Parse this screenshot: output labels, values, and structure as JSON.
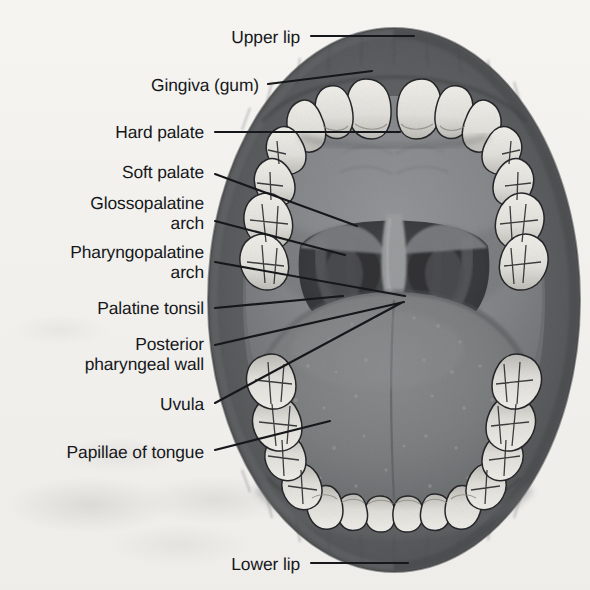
{
  "figure": {
    "view": "anterior view of open mouth",
    "style": "grayscale halftone textbook illustration on scanned paper"
  },
  "colors": {
    "paper": "#f2f1ee",
    "lip_outer": "#5d5f60",
    "lip_inner": "#4b4d4f",
    "mucosa": "#6f7173",
    "palate": "#828486",
    "tongue": "#7b7d7e",
    "throat_dark": "#3a3c3e",
    "tooth": "#e7e6e1",
    "tooth_shadow": "#b9b7b1",
    "outline": "#222325",
    "leader": "#16171a",
    "text": "#16171a"
  },
  "labels": [
    {
      "id": "upper-lip",
      "text": "Upper lip",
      "text_x": 300,
      "text_y": 37,
      "leader": [
        [
          311,
          36
        ],
        [
          414,
          36
        ]
      ],
      "lines": 1
    },
    {
      "id": "gingiva-gum",
      "text": "Gingiva (gum)",
      "text_x": 259,
      "text_y": 85,
      "leader": [
        [
          268,
          84
        ],
        [
          372,
          71
        ]
      ],
      "lines": 1
    },
    {
      "id": "hard-palate",
      "text": "Hard palate",
      "text_x": 204,
      "text_y": 132,
      "leader": [
        [
          215,
          132
        ],
        [
          400,
          132
        ]
      ],
      "lines": 1
    },
    {
      "id": "soft-palate",
      "text": "Soft palate",
      "text_x": 204,
      "text_y": 172,
      "leader": [
        [
          215,
          174
        ],
        [
          357,
          226
        ]
      ],
      "lines": 1
    },
    {
      "id": "glossopalatine-arch",
      "text": "Glossopalatine\narch",
      "text_x": 204,
      "text_y": 213,
      "leader": [
        [
          215,
          221
        ],
        [
          345,
          255
        ]
      ],
      "lines": 2
    },
    {
      "id": "pharyngopalatine-arch",
      "text": "Pharyngopalatine\narch",
      "text_x": 204,
      "text_y": 262,
      "leader": [
        [
          215,
          262
        ],
        [
          405,
          296
        ]
      ],
      "lines": 2
    },
    {
      "id": "palatine-tonsil",
      "text": "Palatine tonsil",
      "text_x": 204,
      "text_y": 308,
      "leader": [
        [
          215,
          308
        ],
        [
          343,
          296
        ]
      ],
      "lines": 1
    },
    {
      "id": "posterior-pharyngeal-wall",
      "text": "Posterior\npharyngeal wall",
      "text_x": 204,
      "text_y": 354,
      "leader": [
        [
          215,
          345
        ],
        [
          404,
          302
        ]
      ],
      "lines": 2
    },
    {
      "id": "uvula",
      "text": "Uvula",
      "text_x": 204,
      "text_y": 404,
      "leader": [
        [
          215,
          403
        ],
        [
          401,
          303
        ]
      ],
      "lines": 1
    },
    {
      "id": "papillae-of-tongue",
      "text": "Papillae of tongue",
      "text_x": 204,
      "text_y": 452,
      "leader": [
        [
          215,
          450
        ],
        [
          330,
          421
        ]
      ],
      "lines": 1
    },
    {
      "id": "lower-lip",
      "text": "Lower lip",
      "text_x": 300,
      "text_y": 564,
      "leader": [
        [
          311,
          563
        ],
        [
          408,
          563
        ]
      ],
      "lines": 1
    }
  ],
  "structures": {
    "upper_lip": "Upper lip",
    "lower_lip": "Lower lip",
    "gingiva": "Gingiva (gum)",
    "hard_palate": "Hard palate",
    "soft_palate": "Soft palate",
    "glossopalatine_arch": "Glossopalatine arch",
    "pharyngopalatine_arch": "Pharyngopalatine arch",
    "palatine_tonsil": "Palatine tonsil",
    "posterior_pharyngeal_wall": "Posterior pharyngeal wall",
    "uvula": "Uvula",
    "tongue": "Papillae of tongue"
  },
  "teeth": {
    "upper_count": 14,
    "lower_count": 14,
    "note": "upper and lower dental arches visible"
  }
}
